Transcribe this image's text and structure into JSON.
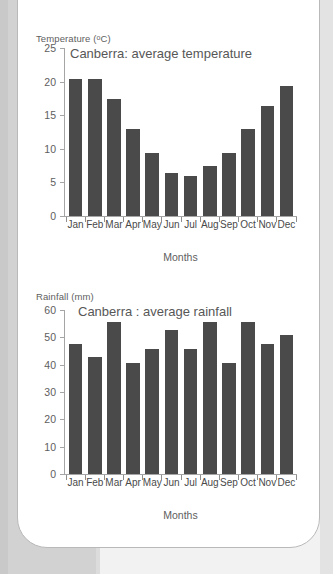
{
  "page": {
    "background_color": "#f2f2f2",
    "card_border_color": "#b9b9b9"
  },
  "charts": [
    {
      "id": "temperature",
      "y_unit_label_main": "Temperature (",
      "y_unit_label_sup": "o",
      "y_unit_label_tail": "C)",
      "y_unit_label_full": "Temperature (ºC)",
      "title": "Canberra: average temperature",
      "x_axis_title": "Months",
      "y_ticks": [
        "25",
        "20",
        "15",
        "10",
        "5",
        "0"
      ],
      "x_labels": [
        "Jan",
        "Feb",
        "Mar",
        "Apr",
        "May",
        "Jun",
        "Jul",
        "Aug",
        "Sep",
        "Oct",
        "Nov",
        "Dec"
      ]
    },
    {
      "id": "rainfall",
      "y_unit_label_full": "Rainfall (mm)",
      "title": "Canberra : average rainfall",
      "x_axis_title": "Months",
      "y_ticks": [
        "60",
        "50",
        "40",
        "30",
        "20",
        "10",
        "0"
      ],
      "x_labels": [
        "Jan",
        "Feb",
        "Mar",
        "Apr",
        "May",
        "Jun",
        "Jul",
        "Aug",
        "Sep",
        "Oct",
        "Nov",
        "Dec"
      ]
    }
  ],
  "chart_data": [
    {
      "type": "bar",
      "title": "Canberra: average temperature",
      "xlabel": "Months",
      "ylabel": "Temperature (ºC)",
      "categories": [
        "Jan",
        "Feb",
        "Mar",
        "Apr",
        "May",
        "Jun",
        "Jul",
        "Aug",
        "Sep",
        "Oct",
        "Nov",
        "Dec"
      ],
      "values": [
        20.5,
        20.5,
        17.5,
        13.0,
        9.5,
        6.5,
        6.0,
        7.5,
        9.5,
        13.0,
        16.5,
        19.5
      ],
      "ylim": [
        0,
        25
      ],
      "ytick_step": 5,
      "yticks": [
        0,
        5,
        10,
        15,
        20,
        25
      ],
      "grid": false,
      "legend": false,
      "bar_color": "#4a4a4a"
    },
    {
      "type": "bar",
      "title": "Canberra : average rainfall",
      "xlabel": "Months",
      "ylabel": "Rainfall (mm)",
      "categories": [
        "Jan",
        "Feb",
        "Mar",
        "Apr",
        "May",
        "Jun",
        "Jul",
        "Aug",
        "Sep",
        "Oct",
        "Nov",
        "Dec"
      ],
      "values": [
        48,
        43,
        56,
        41,
        46,
        53,
        46,
        56,
        41,
        56,
        48,
        51
      ],
      "ylim": [
        0,
        60
      ],
      "ytick_step": 10,
      "yticks": [
        0,
        10,
        20,
        30,
        40,
        50,
        60
      ],
      "grid": false,
      "legend": false,
      "bar_color": "#4a4a4a"
    }
  ]
}
